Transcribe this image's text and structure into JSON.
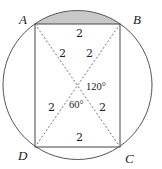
{
  "diagram": {
    "type": "inscribed-rectangle-in-circle",
    "colors": {
      "stroke": "#555555",
      "dashed": "#666666",
      "shaded_segment": "#c8c8c8",
      "text": "#222222"
    },
    "vertices": {
      "A": "A",
      "B": "B",
      "C": "C",
      "D": "D"
    },
    "labels": {
      "side_ab": "2",
      "side_dc": "2",
      "seg_oa": "2",
      "seg_ob": "2",
      "seg_od": "2",
      "seg_oc": "2",
      "angle_boc": "120°",
      "angle_doc": "60°"
    },
    "shaded_region": "circular segment above chord AB"
  }
}
